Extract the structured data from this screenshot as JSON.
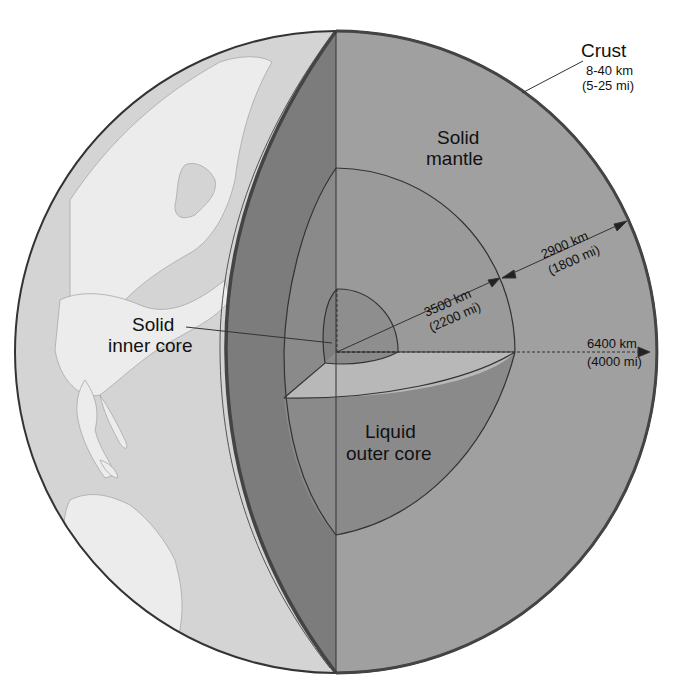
{
  "diagram": {
    "colors": {
      "background": "#ffffff",
      "globe_ocean": "#d4d4d4",
      "globe_land": "#ececec",
      "crust_edge": "#555555",
      "mantle_cut_face": "#7c7c7c",
      "mantle_front_face": "#a0a0a0",
      "outer_core": "#8a8a8a",
      "outer_core_plane": "#b8b8b8",
      "inner_core": "#8e8e8e",
      "outline": "#333333"
    },
    "labels": {
      "crust": {
        "title": "Crust",
        "km": "8-40 km",
        "mi": "(5-25 mi)"
      },
      "mantle": {
        "line1": "Solid",
        "line2": "mantle"
      },
      "inner_core": {
        "line1": "Solid",
        "line2": "inner core"
      },
      "outer_core": {
        "line1": "Liquid",
        "line2": "outer core"
      }
    },
    "measurements": {
      "mantle_thickness": {
        "km": "2900 km",
        "mi": "(1800 mi)"
      },
      "core_radius": {
        "km": "3500 km",
        "mi": "(2200 mi)"
      },
      "earth_radius": {
        "km": "6400 km",
        "mi": "(4000 mi)"
      }
    }
  }
}
